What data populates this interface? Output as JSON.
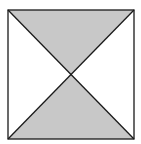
{
  "diagram": {
    "type": "square-with-diagonals",
    "square": {
      "x1": 8,
      "y1": 10,
      "x2": 134,
      "y2": 139
    },
    "center": {
      "x": 71,
      "y": 74.5
    },
    "regions": [
      {
        "name": "top-triangle",
        "fill": "#c8c8c8",
        "shaded": true
      },
      {
        "name": "bottom-triangle",
        "fill": "#c8c8c8",
        "shaded": true
      },
      {
        "name": "left-triangle",
        "fill": "#ffffff",
        "shaded": false
      },
      {
        "name": "right-triangle",
        "fill": "#ffffff",
        "shaded": false
      }
    ],
    "stroke": "#1a1a1a"
  }
}
